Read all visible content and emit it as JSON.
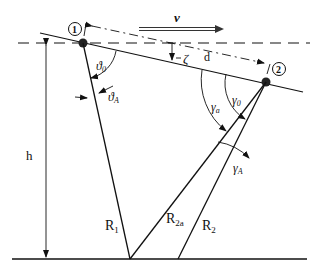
{
  "diagram": {
    "type": "geometry-reflection",
    "labels": {
      "point1": "1",
      "point2": "2",
      "velocity": "v",
      "height": "h",
      "zeta": "ζ",
      "distance": "d",
      "theta0": "ϑ",
      "theta0_sub": "0",
      "thetaA": "ϑ",
      "thetaA_sub": "A",
      "gamma0": "γ",
      "gamma0_sub": "0",
      "gammaA": "γ",
      "gammaA_sub": "a",
      "gammaA2": "γ",
      "gammaA2_sub": "A",
      "R1": "R",
      "R1_sub": "1",
      "R2a": "R",
      "R2a_sub": "2a",
      "R2": "R",
      "R2_sub": "2"
    },
    "colors": {
      "line": "#111111",
      "background": "#ffffff"
    }
  }
}
